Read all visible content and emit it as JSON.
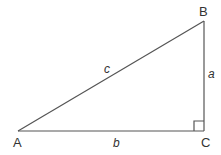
{
  "diagram": {
    "colors": {
      "stroke": "#555555",
      "text": "#333333",
      "background": "#ffffff"
    },
    "vertices": {
      "A": {
        "label": "A",
        "x": 18,
        "y": 131
      },
      "B": {
        "label": "B",
        "x": 204,
        "y": 21
      },
      "C": {
        "label": "C",
        "x": 204,
        "y": 131
      }
    },
    "sides": {
      "a": {
        "label": "a",
        "from": "B",
        "to": "C"
      },
      "b": {
        "label": "b",
        "from": "A",
        "to": "C"
      },
      "c": {
        "label": "c",
        "from": "A",
        "to": "B"
      }
    },
    "right_angle_at": "C"
  }
}
